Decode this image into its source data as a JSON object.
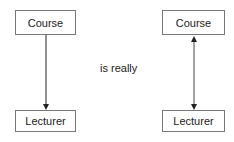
{
  "left_diagram": {
    "top_box": "Course",
    "bottom_box": "Lecturer",
    "connector": "one-way arrow pointing down"
  },
  "middle_text": "is really",
  "right_diagram": {
    "top_box": "Course",
    "bottom_box": "Lecturer",
    "connector": "two-way arrow"
  },
  "colors": {
    "line": "#222222",
    "border": "#777777"
  }
}
